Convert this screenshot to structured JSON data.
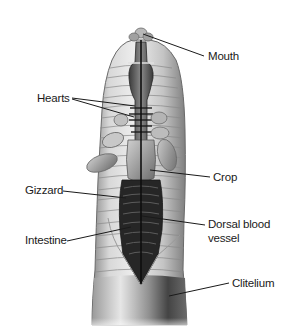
{
  "diagram": {
    "labels": {
      "mouth": "Mouth",
      "hearts": "Hearts",
      "crop": "Crop",
      "gizzard": "Gizzard",
      "dorsal_line1": "Dorsal blood",
      "dorsal_line2": "vessel",
      "intestine": "Intestine",
      "clitelium": "Clitelium"
    },
    "colors": {
      "background": "#ffffff",
      "body_light": "#e4e4e4",
      "body_mid": "#a8a8a8",
      "body_dark": "#4a4a4a",
      "cavity": "#262626",
      "leader_line": "#1a1a1a",
      "text": "#1a1a1a"
    }
  }
}
